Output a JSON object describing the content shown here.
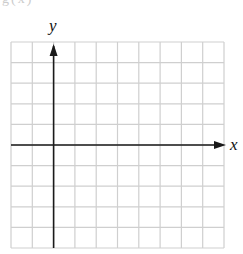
{
  "figure": {
    "type": "coordinate-grid",
    "x_axis_label": "x",
    "y_axis_label": "y",
    "cut_off_text": "g(x)",
    "grid": {
      "columns": 10,
      "rows": 10,
      "left": 11,
      "top": 42,
      "right": 224,
      "bottom": 248,
      "origin_column": 2,
      "origin_row": 5
    },
    "colors": {
      "grid_line": "#cfcfcf",
      "axis": "#1a1a1a",
      "label": "#111111",
      "background": "#ffffff"
    }
  }
}
